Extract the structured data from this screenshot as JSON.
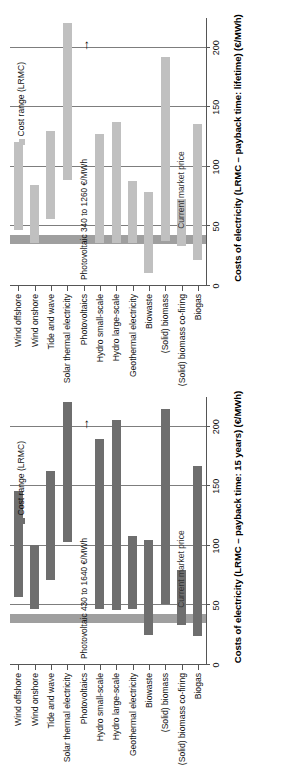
{
  "figure": {
    "categories": [
      "Wind offshore",
      "Wind onshore",
      "Tide and wave",
      "Solar thermal electricity",
      "Photovoltaics",
      "Hydro small-scale",
      "Hydro large-scale",
      "Geothermal electricity",
      "Biowaste",
      "(Solid) biomass",
      "(Solid) biomass co-firing",
      "Biogas"
    ],
    "legend_label": "Cost range (LRMC)",
    "market_price_label": "Current market price",
    "colors": {
      "bar_lifetime": "#c0c0c0",
      "bar_15years": "#6e6e6e",
      "market_band": "#9a9a9a",
      "gridline": "#7d7d7d",
      "axis": "#555555"
    }
  },
  "chart_data": [
    {
      "type": "bar",
      "panel_id": "15-years",
      "title": "Costs of electricity (LRMC – payback time: 15 years) (€/MWh)",
      "xlabel": "Costs of electricity (LRMC – payback time: 15 years) (€/MWh)",
      "ylabel": "",
      "orientation": "horizontal",
      "value_unit": "€/MWh",
      "xlim": [
        0,
        225
      ],
      "xticks": [
        0,
        50,
        100,
        150,
        200
      ],
      "xticklabels": [
        "0",
        "50",
        "100",
        "150",
        "200"
      ],
      "grid": true,
      "legend_position": "top-left",
      "market_price_band": {
        "low": 35,
        "high": 43,
        "label": "Current market price"
      },
      "annotation": {
        "text": "Photovoltaic 430 to 1640 €/MWh",
        "category": "Photovoltaics",
        "arrow": "up"
      },
      "categories": [
        "Wind offshore",
        "Wind onshore",
        "Tide and wave",
        "Solar thermal electricity",
        "Photovoltaics",
        "Hydro small-scale",
        "Hydro large-scale",
        "Geothermal electricity",
        "Biowaste",
        "(Solid) biomass",
        "(Solid) biomass co-firing",
        "Biogas"
      ],
      "ranges": [
        {
          "category": "Wind offshore",
          "low": 57,
          "high": 146,
          "offscale": false
        },
        {
          "category": "Wind onshore",
          "low": 47,
          "high": 101,
          "offscale": false
        },
        {
          "category": "Tide and wave",
          "low": 71,
          "high": 163,
          "offscale": false
        },
        {
          "category": "Solar thermal electricity",
          "low": 103,
          "high": 221,
          "offscale": false
        },
        {
          "category": "Photovoltaics",
          "low": 430,
          "high": 1640,
          "offscale": true
        },
        {
          "category": "Hydro small-scale",
          "low": 47,
          "high": 190,
          "offscale": false
        },
        {
          "category": "Hydro large-scale",
          "low": 46,
          "high": 206,
          "offscale": false
        },
        {
          "category": "Geothermal electricity",
          "low": 47,
          "high": 108,
          "offscale": false
        },
        {
          "category": "Biowaste",
          "low": 25,
          "high": 105,
          "offscale": false
        },
        {
          "category": "(Solid) biomass",
          "low": 51,
          "high": 215,
          "offscale": false
        },
        {
          "category": "(Solid) biomass co-firing",
          "low": 34,
          "high": 80,
          "offscale": false
        },
        {
          "category": "Biogas",
          "low": 24,
          "high": 167,
          "offscale": false
        }
      ]
    },
    {
      "type": "bar",
      "panel_id": "lifetime",
      "title": "Costs of electricity (LRMC – payback time: lifetime) (€/MWh)",
      "xlabel": "Costs of electricity (LRMC – payback time: lifetime) (€/MWh)",
      "ylabel": "",
      "orientation": "horizontal",
      "value_unit": "€/MWh",
      "xlim": [
        0,
        225
      ],
      "xticks": [
        0,
        50,
        100,
        150,
        200
      ],
      "xticklabels": [
        "0",
        "50",
        "100",
        "150",
        "200"
      ],
      "grid": true,
      "legend_position": "top-left",
      "market_price_band": {
        "low": 35,
        "high": 43,
        "label": "Current market price"
      },
      "annotation": {
        "text": "Photovoltaic 340 to 1260 €/MWh",
        "category": "Photovoltaics",
        "arrow": "up"
      },
      "categories": [
        "Wind offshore",
        "Wind onshore",
        "Tide and wave",
        "Solar thermal electricity",
        "Photovoltaics",
        "Hydro small-scale",
        "Hydro large-scale",
        "Geothermal electricity",
        "Biowaste",
        "(Solid) biomass",
        "(Solid) biomass co-firing",
        "Biogas"
      ],
      "ranges": [
        {
          "category": "Wind offshore",
          "low": 47,
          "high": 121,
          "offscale": false
        },
        {
          "category": "Wind onshore",
          "low": 36,
          "high": 85,
          "offscale": false
        },
        {
          "category": "Tide and wave",
          "low": 56,
          "high": 130,
          "offscale": false
        },
        {
          "category": "Solar thermal electricity",
          "low": 89,
          "high": 221,
          "offscale": false
        },
        {
          "category": "Photovoltaics",
          "low": 340,
          "high": 1260,
          "offscale": true
        },
        {
          "category": "Hydro small-scale",
          "low": 36,
          "high": 128,
          "offscale": false
        },
        {
          "category": "Hydro large-scale",
          "low": 36,
          "high": 138,
          "offscale": false
        },
        {
          "category": "Geothermal electricity",
          "low": 36,
          "high": 88,
          "offscale": false
        },
        {
          "category": "Biowaste",
          "low": 11,
          "high": 79,
          "offscale": false
        },
        {
          "category": "(Solid) biomass",
          "low": 38,
          "high": 192,
          "offscale": false
        },
        {
          "category": "(Solid) biomass co-firing",
          "low": 34,
          "high": 73,
          "offscale": false
        },
        {
          "category": "Biogas",
          "low": 22,
          "high": 136,
          "offscale": false
        }
      ]
    }
  ]
}
